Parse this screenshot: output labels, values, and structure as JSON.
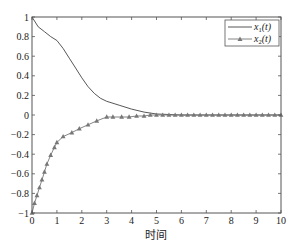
{
  "chart_data": {
    "type": "line",
    "title": "",
    "xlabel": "时间",
    "ylabel": "",
    "xlim": [
      0,
      10
    ],
    "ylim": [
      -1,
      1
    ],
    "xticks": [
      0,
      1,
      2,
      3,
      4,
      5,
      6,
      7,
      8,
      9,
      10
    ],
    "yticks": [
      1,
      0.8,
      0.6,
      0.4,
      0.2,
      0,
      -0.2,
      -0.4,
      -0.6,
      -0.8,
      -1
    ],
    "ytick_labels": [
      "1",
      "0.8",
      "0.6",
      "0.4",
      "0.2",
      "0",
      "-0.2",
      "-0.4",
      "-0.6",
      "-0.8",
      "-1"
    ],
    "grid": false,
    "legend_position": "upper right",
    "series": [
      {
        "name": "x1(t)",
        "legend_main": "x",
        "legend_sub": "1",
        "legend_tail": "(t)",
        "marker": "none",
        "color": "#444444",
        "x": [
          0,
          0.25,
          0.5,
          0.75,
          1.0,
          1.25,
          1.5,
          1.75,
          2.0,
          2.25,
          2.5,
          2.75,
          3.0,
          3.5,
          4.0,
          4.5,
          5.0,
          6,
          7,
          8,
          9,
          10
        ],
        "values": [
          1.0,
          0.9,
          0.85,
          0.8,
          0.76,
          0.68,
          0.58,
          0.48,
          0.38,
          0.29,
          0.22,
          0.17,
          0.14,
          0.1,
          0.06,
          0.03,
          0.01,
          0.0,
          0.0,
          0.0,
          0.0,
          0.0
        ]
      },
      {
        "name": "x2(t)",
        "legend_main": "x",
        "legend_sub": "2",
        "legend_tail": "(t)",
        "marker": "triangle",
        "color": "#777777",
        "x": [
          0,
          0.1,
          0.2,
          0.3,
          0.4,
          0.5,
          0.6,
          0.75,
          0.9,
          1.0,
          1.25,
          1.6,
          1.9,
          2.25,
          2.6,
          3.0,
          3.25,
          3.6,
          3.9,
          4.2,
          4.5,
          4.75,
          5.0,
          5.25,
          5.5,
          5.75,
          6.0,
          6.25,
          6.5,
          6.75,
          7.0,
          7.25,
          7.5,
          7.75,
          8.0,
          8.25,
          8.5,
          8.75,
          9.0,
          9.25,
          9.5,
          9.75,
          10.0
        ],
        "values": [
          -1.0,
          -0.9,
          -0.82,
          -0.74,
          -0.66,
          -0.58,
          -0.5,
          -0.41,
          -0.33,
          -0.28,
          -0.22,
          -0.18,
          -0.14,
          -0.1,
          -0.06,
          -0.02,
          -0.02,
          -0.02,
          -0.02,
          -0.01,
          -0.01,
          0.0,
          0.0,
          0.0,
          0.0,
          0.0,
          0.0,
          0.0,
          0.0,
          0.0,
          0.0,
          0.0,
          0.0,
          0.0,
          0.0,
          0.0,
          0.0,
          0.0,
          0.0,
          0.0,
          0.0,
          0.0,
          0.0
        ]
      }
    ]
  }
}
